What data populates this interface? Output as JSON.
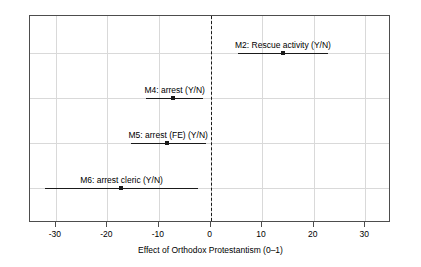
{
  "chart_data": {
    "type": "scatter",
    "title": "",
    "subtitle": "",
    "xlabel": "Effect of Orthodox Protestantism (0–1)",
    "ylabel": "",
    "xlim": [
      -35,
      35
    ],
    "xticks": [
      -30,
      -20,
      -10,
      0,
      10,
      20,
      30
    ],
    "xticklabels": [
      "-30",
      "-20",
      "-10",
      "0",
      "10",
      "20",
      "30"
    ],
    "grid": true,
    "legend": null,
    "reference_line": {
      "value": 0,
      "style": "dashed",
      "color": "#1a1a1a"
    },
    "point_estimates": [
      {
        "label": "M2: Rescue activity (Y/N)",
        "estimate": 14.1,
        "ci_low": 5.3,
        "ci_high": 22.8,
        "label_align": "center"
      },
      {
        "label": "M4: arrest (Y/N)",
        "estimate": -7.3,
        "ci_low": -12.5,
        "ci_high": -1.4,
        "label_align": "center"
      },
      {
        "label": "M5: arrest (FE) (Y/N)",
        "estimate": -8.4,
        "ci_low": -15.5,
        "ci_high": -0.9,
        "label_align": "center"
      },
      {
        "label": "M6: arrest cleric (Y/N)",
        "estimate": -17.4,
        "ci_low": -32.0,
        "ci_high": -2.5,
        "label_align": "center"
      }
    ]
  },
  "colors": {
    "axis": "#4d4d4d",
    "grid": "#d9d9d9",
    "marker": "#1a1a1a",
    "background": "#ffffff"
  }
}
